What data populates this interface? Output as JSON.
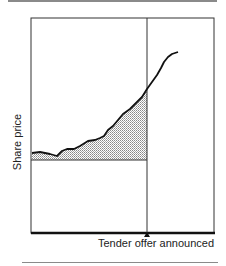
{
  "diagram": {
    "y_axis_label": "Share price",
    "event_label": "Tender offer announced",
    "event_marker": "triangle-up",
    "colors": {
      "line": "#111111",
      "frame": "#333333",
      "shade": "#bdbdbd",
      "rule": "#8a8a8a"
    }
  }
}
